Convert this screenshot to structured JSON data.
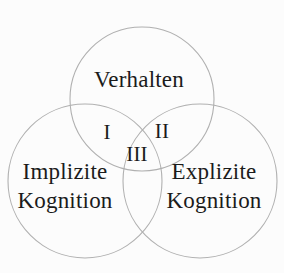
{
  "diagram": {
    "type": "venn-3",
    "background_color": "#fcfcfc",
    "stroke_color": "#b0b0b0",
    "text_color": "#1b1b1b",
    "sets": {
      "top": {
        "label": "Verhalten"
      },
      "left": {
        "line1": "Implizite",
        "line2": "Kognition"
      },
      "right": {
        "line1": "Explizite",
        "line2": "Kognition"
      }
    },
    "regions": {
      "top_left_overlap": "I",
      "top_right_overlap": "II",
      "center_overlap": "III"
    }
  }
}
